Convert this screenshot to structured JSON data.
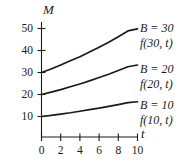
{
  "figure": {
    "background_color": "#ffffff",
    "ink_color": "#1a1a1a"
  },
  "axes": {
    "y_axis_label": "M",
    "x_axis_label": "t",
    "y_ticks": [
      "10",
      "20",
      "30",
      "40",
      "50"
    ],
    "x_ticks": [
      "0",
      "2",
      "4",
      "6",
      "8",
      "10"
    ]
  },
  "curve_labels": [
    {
      "equation": "B = 30",
      "function": "f(30, t)"
    },
    {
      "equation": "B = 20",
      "function": "f(20, t)"
    },
    {
      "equation": "B = 10",
      "function": "f(10, t)"
    }
  ],
  "chart_data": {
    "type": "line",
    "title": "",
    "subtitle": "",
    "xlabel": "t",
    "ylabel": "M",
    "xlim": [
      0,
      10.6
    ],
    "ylim": [
      0,
      55
    ],
    "grid": false,
    "legend_position": "right-inline",
    "x_ticks": [
      0,
      2,
      4,
      6,
      8,
      10
    ],
    "y_ticks": [
      10,
      20,
      30,
      40,
      50
    ],
    "x": [
      0,
      1,
      2,
      3,
      4,
      5,
      6,
      7,
      8,
      9,
      10
    ],
    "series": [
      {
        "name": "B = 30",
        "annotation": "f(30, t)",
        "color": "#1a1a1a",
        "values": [
          30,
          31.6,
          33.4,
          35.3,
          37.2,
          39.3,
          41.5,
          43.8,
          46.3,
          48.9,
          49.8
        ]
      },
      {
        "name": "B = 20",
        "annotation": "f(20, t)",
        "color": "#1a1a1a",
        "values": [
          20,
          21.1,
          22.2,
          23.5,
          24.8,
          26.2,
          27.7,
          29.2,
          30.9,
          32.6,
          33.4
        ]
      },
      {
        "name": "B = 10",
        "annotation": "f(10, t)",
        "color": "#1a1a1a",
        "values": [
          10,
          10.5,
          11.1,
          11.7,
          12.4,
          13.1,
          13.8,
          14.6,
          15.4,
          16.3,
          16.7
        ]
      }
    ]
  }
}
